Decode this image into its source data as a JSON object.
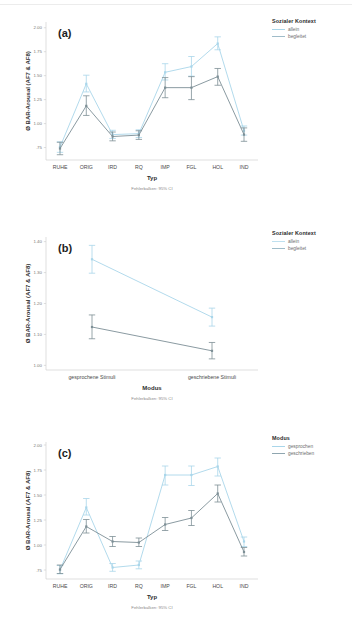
{
  "figure": {
    "footnote": "Fehlerbalken: 95% CI",
    "colors": {
      "light": "#a9d6ea",
      "dark": "#7d8f96",
      "axis": "#c9c9c9",
      "text": "#4a4a4a"
    }
  },
  "chart_data": [
    {
      "id": "a",
      "tag": "(a)",
      "type": "line",
      "title": "",
      "xlabel": "Typ",
      "ylabel": "Ø BAR-Arousal (AF7 & AF8)",
      "footnote": "Fehlerbalken: 95% CI",
      "categories": [
        "RUHE",
        "ORIG",
        "IRD",
        "RQ",
        "IMP",
        "FGL",
        "HOL",
        "IND"
      ],
      "yticks": [
        "2.00",
        "1.75",
        "1.50",
        "1.25",
        "1.00",
        ".75"
      ],
      "ytickvals": [
        2.0,
        1.75,
        1.5,
        1.25,
        1.0,
        0.75
      ],
      "ylim": [
        0.62,
        2.06
      ],
      "grid": false,
      "legend": {
        "title": "Sozialer Kontext",
        "position": "right",
        "entries": [
          {
            "label": "allein",
            "color": "#a9d6ea"
          },
          {
            "label": "begleitet",
            "color": "#7d8f96"
          }
        ]
      },
      "series": [
        {
          "name": "allein",
          "color": "#a9d6ea",
          "values": [
            0.755,
            1.415,
            0.885,
            0.895,
            1.535,
            1.595,
            1.835,
            0.925
          ],
          "ci_low": [
            0.7,
            1.33,
            0.845,
            0.855,
            1.455,
            1.495,
            1.77,
            0.88
          ],
          "ci_high": [
            0.81,
            1.505,
            0.93,
            0.935,
            1.625,
            1.7,
            1.905,
            0.975
          ]
        },
        {
          "name": "begleitet",
          "color": "#7d8f96",
          "values": [
            0.74,
            1.185,
            0.865,
            0.88,
            1.375,
            1.375,
            1.49,
            0.885
          ],
          "ci_low": [
            0.675,
            1.085,
            0.82,
            0.835,
            1.27,
            1.25,
            1.4,
            0.815
          ],
          "ci_high": [
            0.805,
            1.29,
            0.912,
            0.925,
            1.48,
            1.49,
            1.575,
            0.955
          ]
        }
      ]
    },
    {
      "id": "b",
      "tag": "(b)",
      "type": "line",
      "title": "",
      "xlabel": "Modus",
      "ylabel": "Ø BAR-Arousal (AF7 & AF8)",
      "footnote": "Fehlerbalken: 95% CI",
      "categories": [
        "gesprochene Stimuli",
        "geschriebene Stimuli"
      ],
      "yticks": [
        "1.40",
        "1.30",
        "1.20",
        "1.10",
        "1.00"
      ],
      "ytickvals": [
        1.4,
        1.3,
        1.2,
        1.1,
        1.0
      ],
      "ylim": [
        0.985,
        1.415
      ],
      "grid": false,
      "legend": {
        "title": "Sozialer Kontext",
        "position": "right",
        "entries": [
          {
            "label": "allein",
            "color": "#a9d6ea"
          },
          {
            "label": "begleitet",
            "color": "#7d8f96"
          }
        ]
      },
      "series": [
        {
          "name": "allein",
          "color": "#a9d6ea",
          "values": [
            1.343,
            1.156
          ],
          "ci_low": [
            1.298,
            1.127
          ],
          "ci_high": [
            1.388,
            1.185
          ]
        },
        {
          "name": "begleitet",
          "color": "#7d8f96",
          "values": [
            1.124,
            1.047
          ],
          "ci_low": [
            1.086,
            1.021
          ],
          "ci_high": [
            1.163,
            1.074
          ]
        }
      ]
    },
    {
      "id": "c",
      "tag": "(c)",
      "type": "line",
      "title": "",
      "xlabel": "Typ",
      "ylabel": "Ø BAR-Arousal (AF7 & AF8)",
      "footnote": "Fehlerbalken: 95% CI",
      "categories": [
        "RUHE",
        "ORIG",
        "IRD",
        "RQ",
        "IMP",
        "FGL",
        "HOL",
        "IND"
      ],
      "yticks": [
        "2.00",
        "1.75",
        "1.50",
        "1.25",
        "1.00",
        ".75"
      ],
      "ytickvals": [
        2.0,
        1.75,
        1.5,
        1.25,
        1.0,
        0.75
      ],
      "ylim": [
        0.66,
        2.03
      ],
      "grid": false,
      "legend": {
        "title": "Modus",
        "position": "right",
        "entries": [
          {
            "label": "gesprochen",
            "color": "#a9d6ea"
          },
          {
            "label": "geschrieben",
            "color": "#7d8f96"
          }
        ]
      },
      "series": [
        {
          "name": "gesprochen",
          "color": "#a9d6ea",
          "values": [
            0.752,
            1.375,
            0.775,
            0.8,
            1.7,
            1.7,
            1.785,
            1.035
          ],
          "ci_low": [
            0.712,
            1.3,
            0.737,
            0.762,
            1.6,
            1.595,
            1.69,
            0.985
          ],
          "ci_high": [
            0.795,
            1.465,
            0.815,
            0.84,
            1.79,
            1.79,
            1.87,
            1.08
          ]
        },
        {
          "name": "geschrieben",
          "color": "#7d8f96",
          "values": [
            0.755,
            1.185,
            1.035,
            1.025,
            1.205,
            1.27,
            1.515,
            0.93
          ],
          "ci_low": [
            0.715,
            1.12,
            0.985,
            0.985,
            1.145,
            1.195,
            1.43,
            0.89
          ],
          "ci_high": [
            0.8,
            1.255,
            1.085,
            1.07,
            1.275,
            1.345,
            1.6,
            0.975
          ]
        }
      ]
    }
  ]
}
